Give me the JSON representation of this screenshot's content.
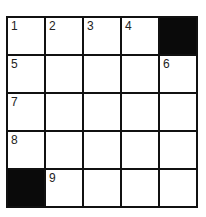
{
  "puzzle": {
    "type": "crossword",
    "rows": 5,
    "cols": 5,
    "cells": [
      [
        {
          "num": "1"
        },
        {
          "num": "2"
        },
        {
          "num": "3"
        },
        {
          "num": "4"
        },
        {
          "black": true
        }
      ],
      [
        {
          "num": "5"
        },
        {},
        {},
        {},
        {
          "num": "6"
        }
      ],
      [
        {
          "num": "7"
        },
        {},
        {},
        {},
        {}
      ],
      [
        {
          "num": "8"
        },
        {},
        {},
        {},
        {}
      ],
      [
        {
          "black": true
        },
        {
          "num": "9"
        },
        {},
        {},
        {}
      ]
    ]
  }
}
